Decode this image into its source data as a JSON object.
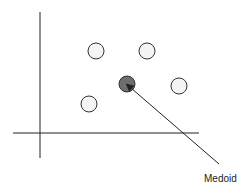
{
  "diagram": {
    "label": "Medoid",
    "colors": {
      "axis": "#222222",
      "point_fill": "#f4f4f4",
      "medoid_fill": "#6e6e6e",
      "stroke": "#333333"
    },
    "points": [
      {
        "x": 96,
        "y": 51,
        "type": "point"
      },
      {
        "x": 147,
        "y": 51,
        "type": "point"
      },
      {
        "x": 127,
        "y": 84,
        "type": "medoid"
      },
      {
        "x": 179,
        "y": 86,
        "type": "point"
      },
      {
        "x": 89,
        "y": 104,
        "type": "point"
      }
    ]
  }
}
